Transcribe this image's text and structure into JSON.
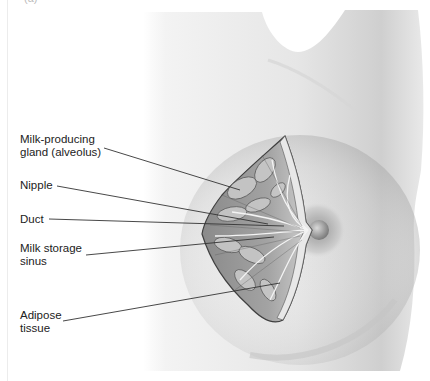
{
  "figure": {
    "panel_label": "(a)",
    "colors": {
      "background": "#ffffff",
      "skin_light": "#f2f2f2",
      "skin_shadow": "#b8b8b8",
      "tissue_dark": "#5a5a5a",
      "label_text": "#222222",
      "leader_line": "#333333"
    }
  },
  "labels": [
    {
      "id": "alveolus",
      "text": "Milk-producing\ngland (alveolus)"
    },
    {
      "id": "nipple",
      "text": "Nipple"
    },
    {
      "id": "duct",
      "text": "Duct"
    },
    {
      "id": "sinus",
      "text": "Milk storage\nsinus"
    },
    {
      "id": "adipose",
      "text": "Adipose\ntissue"
    }
  ]
}
